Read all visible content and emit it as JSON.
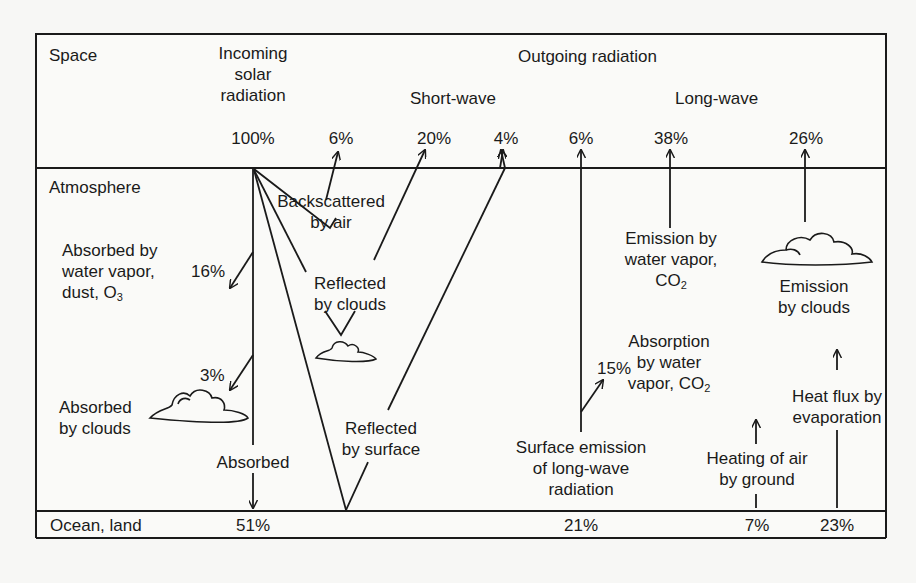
{
  "diagram": {
    "layers": {
      "space": "Space",
      "atmosphere": "Atmosphere",
      "surface": "Ocean, land"
    },
    "headings": {
      "incoming": [
        "Incoming",
        "solar",
        "radiation"
      ],
      "outgoing": "Outgoing radiation",
      "short_wave": "Short-wave",
      "long_wave": "Long-wave"
    },
    "space_values": {
      "incoming": "100%",
      "backscattered": "6%",
      "reflected_clouds": "20%",
      "reflected_surface": "4%",
      "surface_emission_escape": "6%",
      "emission_water_vapor": "38%",
      "emission_clouds": "26%"
    },
    "atmosphere_labels": {
      "absorbed_vapor": [
        "Absorbed by",
        "water vapor,",
        "dust, O"
      ],
      "absorbed_vapor_sub": "3",
      "absorbed_vapor_value": "16%",
      "backscattered": [
        "Backscattered",
        "by air"
      ],
      "reflected_clouds": [
        "Reflected",
        "by clouds"
      ],
      "absorbed_clouds": [
        "Absorbed",
        "by clouds"
      ],
      "absorbed_clouds_value": "3%",
      "absorbed": "Absorbed",
      "reflected_surface": [
        "Reflected",
        "by surface"
      ],
      "emission_vapor": [
        "Emission by",
        "water vapor,",
        "CO"
      ],
      "emission_vapor_sub": "2",
      "emission_clouds": [
        "Emission",
        "by clouds"
      ],
      "absorption_vapor": [
        "Absorption",
        "by water",
        "vapor, CO"
      ],
      "absorption_vapor_sub": "2",
      "absorption_value": "15%",
      "surface_emission": [
        "Surface emission",
        "of long-wave",
        "radiation"
      ],
      "heating_air": [
        "Heating of air",
        "by ground"
      ],
      "heat_flux": [
        "Heat flux by",
        "evaporation"
      ]
    },
    "surface_values": {
      "absorbed": "51%",
      "surface_emission": "21%",
      "heating_air": "7%",
      "heat_flux": "23%"
    }
  }
}
